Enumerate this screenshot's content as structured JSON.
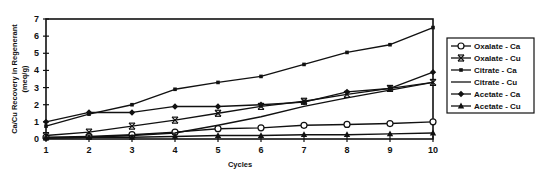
{
  "chart_data": {
    "type": "line",
    "title": "",
    "xlabel": "Cycles",
    "ylabel": "Ca/Cu Recovery in Regenerant",
    "ylabel_units": "(meq/g)",
    "x": [
      1,
      2,
      3,
      4,
      5,
      6,
      7,
      8,
      9,
      10
    ],
    "xlim": [
      1,
      10
    ],
    "ylim": [
      0,
      7
    ],
    "yticks": [
      0,
      1,
      2,
      3,
      4,
      5,
      6,
      7
    ],
    "grid": false,
    "legend_position": "right",
    "series": [
      {
        "name": "Oxalate - Ca",
        "marker": "circle",
        "values": [
          0.1,
          0.15,
          0.25,
          0.4,
          0.6,
          0.65,
          0.8,
          0.85,
          0.9,
          1.0
        ]
      },
      {
        "name": "Oxalate - Cu",
        "marker": "x",
        "values": [
          0.2,
          0.4,
          0.75,
          1.1,
          1.5,
          1.9,
          2.2,
          2.6,
          2.95,
          3.3
        ]
      },
      {
        "name": "Citrate - Ca",
        "marker": "square",
        "values": [
          0.75,
          1.45,
          2.0,
          2.9,
          3.3,
          3.65,
          4.35,
          5.05,
          5.5,
          6.5
        ]
      },
      {
        "name": "Citrate - Cu",
        "marker": "none",
        "values": [
          0.05,
          0.1,
          0.2,
          0.35,
          0.8,
          1.3,
          1.9,
          2.4,
          2.85,
          3.3
        ]
      },
      {
        "name": "Acetate - Ca",
        "marker": "diamond",
        "values": [
          1.0,
          1.55,
          1.55,
          1.9,
          1.9,
          2.0,
          2.15,
          2.75,
          2.95,
          3.9
        ]
      },
      {
        "name": "Acetate - Cu",
        "marker": "triangle",
        "values": [
          0.05,
          0.1,
          0.1,
          0.15,
          0.2,
          0.2,
          0.25,
          0.25,
          0.3,
          0.35
        ]
      }
    ]
  },
  "colors": {
    "line": "#111111",
    "background": "#ffffff"
  }
}
